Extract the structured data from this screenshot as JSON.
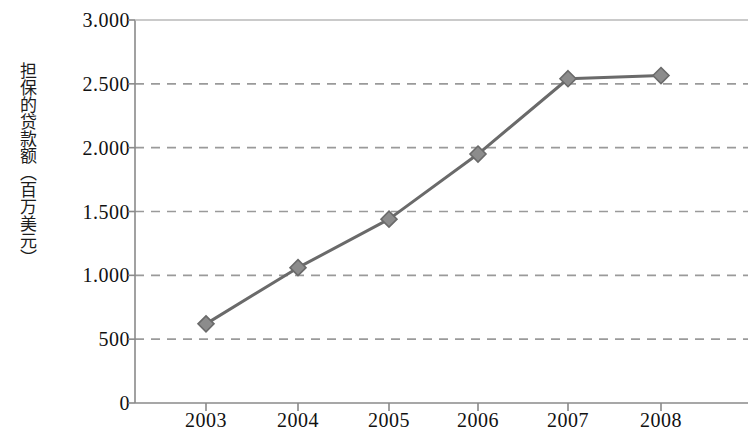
{
  "chart_data": {
    "type": "line",
    "title": "",
    "subtitle": "",
    "xlabel": "",
    "ylabel": "担保的贷款额（百万美元）",
    "categories": [
      "2003",
      "2004",
      "2005",
      "2006",
      "2007",
      "2008"
    ],
    "x": [
      2003,
      2004,
      2005,
      2006,
      2007,
      2008
    ],
    "series": [
      {
        "name": "担保的贷款额",
        "values": [
          620,
          1060,
          1440,
          1950,
          2540,
          2565
        ],
        "color": "#6a6a6a",
        "marker": "diamond",
        "marker_color": "#8c8c8c",
        "line_width": 3
      }
    ],
    "ylim": [
      0,
      3000
    ],
    "ytick_values": [
      0,
      500,
      1000,
      1500,
      2000,
      2500,
      3000
    ],
    "ytick_labels": [
      "0",
      "500",
      "1.000",
      "1.500",
      "2.000",
      "2.500",
      "3.000"
    ],
    "xtick_labels": [
      "2003",
      "2004",
      "2005",
      "2006",
      "2007",
      "2008"
    ],
    "grid": {
      "horizontal": true,
      "vertical": false,
      "style": "dashed",
      "color": "#9a9a9a"
    },
    "legend": {
      "visible": false,
      "position": "none"
    },
    "axis_color": "#8a8a8a",
    "top_border": true,
    "background_color": "#ffffff"
  },
  "layout": {
    "plot_left": 135,
    "plot_right": 748,
    "plot_top": 20,
    "plot_bottom": 403,
    "x_positions": [
      206,
      298,
      389,
      478,
      568,
      661
    ]
  }
}
